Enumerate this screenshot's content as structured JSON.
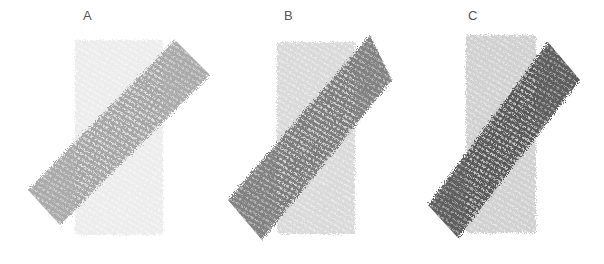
{
  "figure": {
    "panels": [
      {
        "label": "A",
        "band_color": "#8a8a8a",
        "band_opacity": 0.75,
        "rect_color": "#d8d8d8",
        "rect_opacity": 0.5
      },
      {
        "label": "B",
        "band_color": "#6a6a6a",
        "band_opacity": 0.85,
        "rect_color": "#cfcfcf",
        "rect_opacity": 0.8
      },
      {
        "label": "C",
        "band_color": "#4a4a4a",
        "band_opacity": 0.9,
        "rect_color": "#c8c8c8",
        "rect_opacity": 0.85
      }
    ]
  }
}
